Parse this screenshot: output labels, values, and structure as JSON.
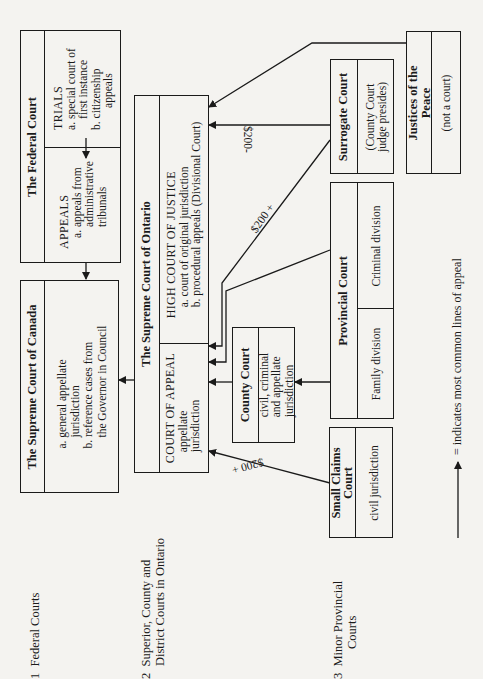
{
  "sections": [
    {
      "number": "1",
      "label": "Federal Courts"
    },
    {
      "number": "2",
      "label_line1": "Superior, County and",
      "label_line2": "District  Courts in Ontario"
    },
    {
      "number": "3",
      "label_line1": "Minor Provincial",
      "label_line2": "Courts"
    }
  ],
  "federal_court": {
    "title": "The Federal Court",
    "trials": {
      "heading": "TRIALS",
      "items": [
        "a. special court of",
        "first instance",
        "b. citizenship",
        "appeals"
      ]
    },
    "appeals": {
      "heading": "APPEALS",
      "items": [
        "a. appeals from",
        "administrative",
        "tribunals"
      ]
    }
  },
  "supreme_court_canada": {
    "title": "The Supreme Court of Canada",
    "items": [
      "a. general appellate",
      "jurisdiction",
      "b. reference cases from",
      "the Governor in Council"
    ]
  },
  "supreme_court_ontario": {
    "title": "The Supreme Court of Ontario",
    "high_court": {
      "heading": "HIGH COURT OF JUSTICE",
      "items": [
        "a. court of original jurisdiction",
        "b. procedural appeals (Divisional Court)"
      ]
    },
    "court_of_appeal": {
      "heading": "COURT OF APPEAL",
      "items": [
        "appellate",
        "jurisdiction"
      ]
    }
  },
  "county_court": {
    "title": "County Court",
    "items": [
      "civil, criminal",
      "and appellate",
      "jurisdiction"
    ]
  },
  "surrogate_court": {
    "title": "Surrogate Court",
    "items": [
      "(County Court",
      "judge presides)"
    ]
  },
  "justices_of_the_peace": {
    "title_line1": "Justices of the",
    "title_line2": "Peace",
    "note": "(not a court)"
  },
  "provincial_court": {
    "title": "Provincial Court",
    "divisions": [
      "Criminal division",
      "Family division"
    ]
  },
  "small_claims_court": {
    "title_line1": "Small Claims",
    "title_line2": "Court",
    "note": "civil jurisdiction"
  },
  "appeal_thresholds": {
    "surrogate_to_high_court": "$200-",
    "surrogate_to_court_of_appeal": "$200 +",
    "small_claims_to_court_of_appeal": "$200 +"
  },
  "legend": {
    "symbol": "arrow-up",
    "text": "= indicates most common lines of appeal"
  }
}
